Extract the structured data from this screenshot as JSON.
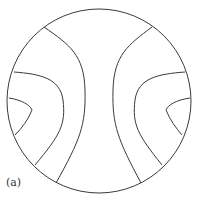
{
  "figure": {
    "label": "(a)",
    "stroke_color": "#3a3a3a"
  }
}
